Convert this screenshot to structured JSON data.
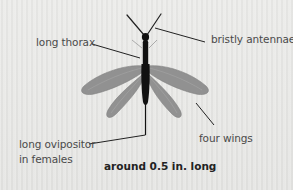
{
  "diagram": {
    "labels": {
      "thorax": "long thorax",
      "antennae": "bristly antennae",
      "wings": "four wings",
      "ovipositor_line1": "long ovipositor",
      "ovipositor_line2": "in females"
    },
    "caption": "around 0.5 in. long",
    "colors": {
      "background": "#e9e9e7",
      "body": "#111111",
      "wing": "#8a8a8a",
      "leader_line": "#222222",
      "label_text": "#4a4a4a",
      "caption_text": "#222222"
    }
  }
}
